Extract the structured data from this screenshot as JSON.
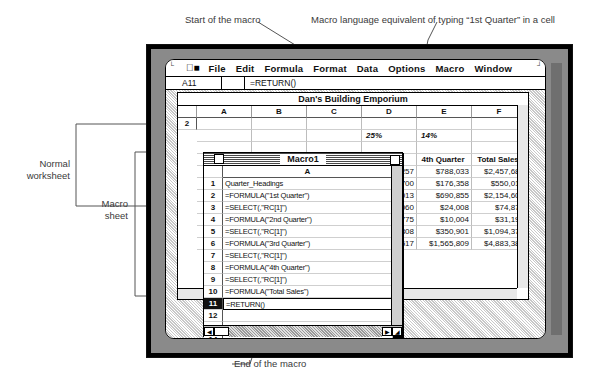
{
  "annotations": {
    "top_left": "Start of the macro",
    "top_right": "Macro language equivalent of typing “1st Quarter” in a cell",
    "left_upper": "Normal\nworksheet",
    "left_upper_line1": "Normal",
    "left_upper_line2": "worksheet",
    "left_lower_line1": "Macro",
    "left_lower_line2": "sheet",
    "bottom_left": "End of the macro",
    "bottom_right": "Moves to new active cell"
  },
  "menubar": {
    "apple_icon": "apple-icon",
    "items": [
      "File",
      "Edit",
      "Formula",
      "Format",
      "Data",
      "Options",
      "Macro",
      "Window"
    ]
  },
  "formula_bar": {
    "cell_reference": "A11",
    "formula": "=RETURN()"
  },
  "worksheet": {
    "title": "Dan's Building Emporium",
    "column_headers": [
      "A",
      "B",
      "C",
      "D",
      "E",
      "F"
    ],
    "row2_label": "2",
    "percent_row": {
      "d": "25%",
      "e": "14%"
    },
    "header_row": {
      "d": "arter",
      "e": "4th Quarter",
      "f": "Total Sales"
    },
    "data_rows": [
      {
        "d": "1,257",
        "e": "$788,033",
        "f": "$2,457,685"
      },
      {
        "d": "4,700",
        "e": "$176,358",
        "f": "$550,018"
      },
      {
        "d": "6,013",
        "e": "$690,855",
        "f": "$2,154,609"
      },
      {
        "d": "1,060",
        "e": "$24,008",
        "f": "$74,876"
      },
      {
        "d": "8,775",
        "e": "$10,004",
        "f": "$31,199"
      },
      {
        "d": "7,808",
        "e": "$350,901",
        "f": "$1,094,374"
      },
      {
        "d": "3,517",
        "e": "$1,565,809",
        "f": "$4,883,380"
      }
    ]
  },
  "macro_window": {
    "title": "Macro1",
    "column_header": "A",
    "rows": [
      {
        "num": "1",
        "formula": "Quarter_Headings"
      },
      {
        "num": "2",
        "formula": "=FORMULA(\"1st Quarter\")"
      },
      {
        "num": "3",
        "formula": "=SELECT(,\"RC[1]\")"
      },
      {
        "num": "4",
        "formula": "=FORMULA(\"2nd Quarter\")"
      },
      {
        "num": "5",
        "formula": "=SELECT(,\"RC[1]\")"
      },
      {
        "num": "6",
        "formula": "=FORMULA(\"3rd Quarter\")"
      },
      {
        "num": "7",
        "formula": "=SELECT(,\"RC[1]\")"
      },
      {
        "num": "8",
        "formula": "=FORMULA(\"4th Quarter\")"
      },
      {
        "num": "9",
        "formula": "=SELECT(,\"RC[1]\")"
      },
      {
        "num": "10",
        "formula": "=FORMULA(\"Total Sales\")"
      },
      {
        "num": "11",
        "formula": "=RETURN()"
      },
      {
        "num": "12",
        "formula": ""
      },
      {
        "num": "13",
        "formula": ""
      },
      {
        "num": "14",
        "formula": ""
      },
      {
        "num": "15",
        "formula": ""
      },
      {
        "num": "16",
        "formula": ""
      }
    ],
    "selected_row": "11"
  },
  "colors": {
    "screen_bg": "#ffffff",
    "bezel": "#8a8a8a",
    "frame": "#000000",
    "selection": "#111111"
  }
}
